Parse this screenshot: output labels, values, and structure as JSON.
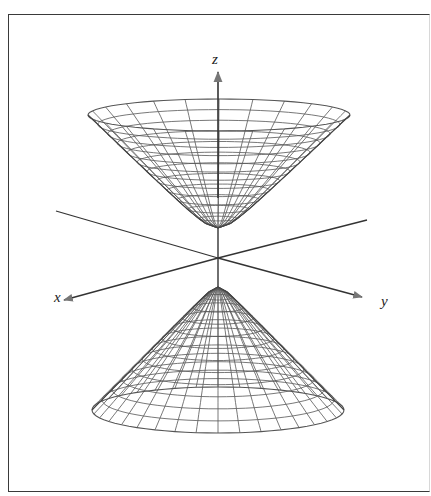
{
  "figure": {
    "axes": {
      "z_label": "z",
      "x_label": "x",
      "y_label": "y",
      "origin": [
        218,
        258
      ],
      "z_axis": {
        "from": [
          218,
          258
        ],
        "to": [
          218,
          72
        ]
      },
      "x_axis": {
        "from": [
          218,
          258
        ],
        "to": [
          64,
          300
        ],
        "back": [
          56,
          211
        ]
      },
      "y_axis": {
        "from": [
          218,
          258
        ],
        "to": [
          362,
          297
        ],
        "back": [
          367,
          220
        ]
      },
      "z_label_pos": [
        212,
        64
      ],
      "x_label_pos": [
        54,
        302
      ],
      "y_label_pos": [
        381,
        306
      ]
    },
    "upper_sheet": {
      "vertex": [
        218,
        228
      ],
      "rim_center": [
        219,
        115
      ],
      "rim_rx": 131,
      "rim_ry": 16,
      "rings": 12,
      "meridians": 24
    },
    "lower_sheet": {
      "vertex": [
        218,
        287
      ],
      "rim_center": [
        218,
        410
      ],
      "rim_rx": 126,
      "rim_ry": 23,
      "rings": 12,
      "meridians": 36
    },
    "colors": {
      "mesh": "#555555",
      "axis": "#333333",
      "frame": "#3a3a3a"
    }
  }
}
